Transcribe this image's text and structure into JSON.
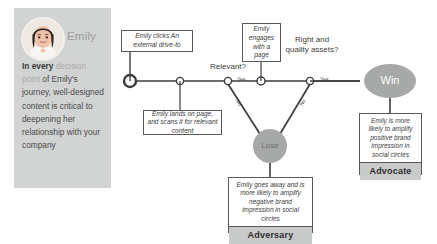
{
  "persona": {
    "name": "Emily",
    "avatar_icon": "woman-avatar-icon",
    "description_part1": "In every ",
    "description_muted": "decision point",
    "description_part2": " of Emily's journey, well-designed content is critical to deepening her relationship with your company"
  },
  "diagram": {
    "notes": {
      "entry": "Emily clicks An external drive-to",
      "landing": "Emily lands on page, and scans it for relevant content",
      "engage": "Emily engages with a page"
    },
    "decisions": {
      "relevant": "Relevant?",
      "quality": "Right and quality assets?"
    },
    "edge_labels": {
      "yes_relevant": "Yes",
      "yes_quality": "Yes",
      "no_relevant": "No",
      "no_quality": "No"
    },
    "terminals": {
      "win": "Win",
      "lose": "Lose"
    },
    "outcomes": {
      "advocate": {
        "text": "Emily is more likely to amplify positive brand impression in social circles",
        "tag": "Advocate"
      },
      "adversary": {
        "text": "Emily goes away and is more likely to amplify negative brand impression in social circles",
        "tag": "Adversary"
      }
    }
  },
  "colors": {
    "panel_bg": "#d2d3d3",
    "node_gray": "#a7a8a8",
    "tag_gray": "#c9caca",
    "line": "#3c3c3c"
  }
}
